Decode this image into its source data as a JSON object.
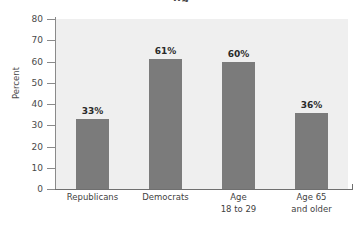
{
  "chart_data": {
    "type": "bar",
    "title": "",
    "title_clipped": "ng",
    "xlabel": "",
    "ylabel": "Percent",
    "ylim": [
      0,
      80
    ],
    "ytick_values": [
      0,
      10,
      20,
      30,
      40,
      50,
      60,
      70,
      80
    ],
    "ytick_labels": [
      "0",
      "10",
      "20",
      "30",
      "40",
      "50",
      "60",
      "70",
      "80"
    ],
    "grid": false,
    "legend": "none",
    "bar_color": "#7b7b7b",
    "plot_background": "#efefef",
    "categories": [
      "Republicans",
      "Democrats",
      "Age 18 to 29",
      "Age 65 and older"
    ],
    "category_lines": [
      [
        "Republicans"
      ],
      [
        "Democrats"
      ],
      [
        "Age",
        "18 to 29"
      ],
      [
        "Age 65",
        "and older"
      ]
    ],
    "values": [
      33,
      61,
      60,
      36
    ],
    "value_labels": [
      "33%",
      "61%",
      "60%",
      "36%"
    ]
  }
}
